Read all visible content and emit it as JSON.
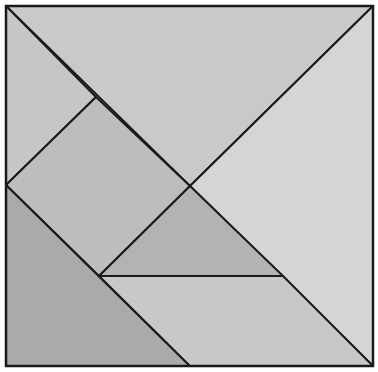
{
  "diagram": {
    "type": "tangram",
    "frame": {
      "x": 6,
      "y": 6,
      "width": 367,
      "height": 360,
      "stroke": "#1a1a1a"
    },
    "pieces": [
      {
        "id": "large-triangle-top",
        "points": "6,6 373,6 190,186",
        "fill": "#c9c9c9"
      },
      {
        "id": "large-triangle-right",
        "points": "373,6 373,366 190,186",
        "fill": "#d5d5d5"
      },
      {
        "id": "small-triangle-top-left",
        "points": "6,6 96,97 6,185",
        "fill": "#c6c6c6"
      },
      {
        "id": "square",
        "points": "6,185 96,97 190,186 99,276",
        "fill": "#bdbdbd"
      },
      {
        "id": "small-triangle-middle",
        "points": "190,186 99,276 283,276",
        "fill": "#b3b3b3"
      },
      {
        "id": "medium-triangle-bottom-left",
        "points": "6,185 6,366 190,366",
        "fill": "#aaaaaa"
      },
      {
        "id": "parallelogram-bottom",
        "points": "99,276 283,276 373,366 190,366",
        "fill": "#c8c8c8"
      }
    ]
  }
}
